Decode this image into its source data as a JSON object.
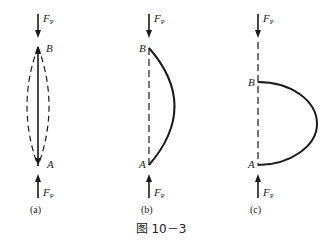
{
  "figure": {
    "caption": "图 10－3",
    "panels": [
      {
        "id": "a",
        "label": "(a)",
        "force_top": {
          "symbol": "F",
          "subscript": "P",
          "direction": "down"
        },
        "force_bottom": {
          "symbol": "F",
          "subscript": "P",
          "direction": "up"
        },
        "point_top": "B",
        "point_bottom": "A",
        "description": "Straight column between A and B with two dashed symmetric bowed buckled shapes (double-headed arrow along axis)"
      },
      {
        "id": "b",
        "label": "(b)",
        "force_top": {
          "symbol": "F",
          "subscript": "P",
          "direction": "down"
        },
        "force_bottom": {
          "symbol": "F",
          "subscript": "P",
          "direction": "up"
        },
        "point_top": "B",
        "point_bottom": "A",
        "description": "Dashed straight axis with solid bowed buckled curve to the right"
      },
      {
        "id": "c",
        "label": "(c)",
        "force_top": {
          "symbol": "F",
          "subscript": "P",
          "direction": "down"
        },
        "force_bottom": {
          "symbol": "F",
          "subscript": "P",
          "direction": "up"
        },
        "point_top": "B",
        "point_bottom": "A",
        "description": "Dashed axis with large solid curved deflection; B lowered relative to original position"
      }
    ]
  },
  "colors": {
    "line": "#1a1a1a",
    "background": "#ffffff"
  }
}
